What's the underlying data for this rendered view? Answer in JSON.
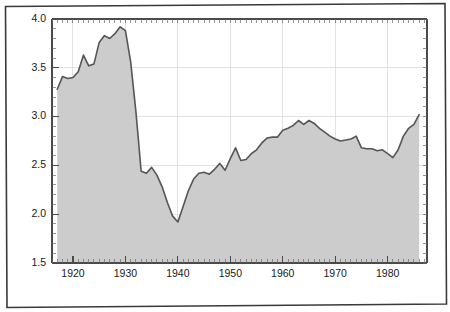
{
  "chart_data": {
    "type": "area",
    "title": "",
    "subtitle": "",
    "xlabel": "",
    "ylabel": "",
    "xlim": [
      1916.0,
      1987.5
    ],
    "ylim": [
      1.5,
      4.0
    ],
    "grid": true,
    "legend": null,
    "annotations": [],
    "x_ticks_major": [
      1920,
      1930,
      1940,
      1950,
      1960,
      1970,
      1980
    ],
    "x_tick_labels": [
      "1920",
      "1930",
      "1940",
      "1950",
      "1960",
      "1970",
      "1980"
    ],
    "x_tick_minor_step": 1,
    "y_ticks_major": [
      1.5,
      2.0,
      2.5,
      3.0,
      3.5,
      4.0
    ],
    "y_tick_labels": [
      "1.5",
      "2.0",
      "2.5",
      "3.0",
      "3.5",
      "4.0"
    ],
    "y_tick_minor_step": 0.1,
    "series": [
      {
        "name": "series-1",
        "line_color": "#555555",
        "fill_color": "#c9c9c9",
        "baseline": 1.5,
        "x": [
          1917,
          1918,
          1919,
          1920,
          1921,
          1922,
          1923,
          1924,
          1925,
          1926,
          1927,
          1928,
          1929,
          1930,
          1931,
          1932,
          1933,
          1934,
          1935,
          1936,
          1937,
          1938,
          1939,
          1940,
          1941,
          1942,
          1943,
          1944,
          1945,
          1946,
          1947,
          1948,
          1949,
          1950,
          1951,
          1952,
          1953,
          1954,
          1955,
          1956,
          1957,
          1958,
          1959,
          1960,
          1961,
          1962,
          1963,
          1964,
          1965,
          1966,
          1967,
          1968,
          1969,
          1970,
          1971,
          1972,
          1973,
          1974,
          1975,
          1976,
          1977,
          1978,
          1979,
          1980,
          1981,
          1982,
          1983,
          1984,
          1985,
          1986
        ],
        "y": [
          3.28,
          3.41,
          3.39,
          3.4,
          3.46,
          3.63,
          3.52,
          3.54,
          3.76,
          3.83,
          3.8,
          3.85,
          3.92,
          3.88,
          3.56,
          3.05,
          2.44,
          2.42,
          2.48,
          2.4,
          2.28,
          2.12,
          1.98,
          1.92,
          2.08,
          2.24,
          2.36,
          2.42,
          2.43,
          2.41,
          2.46,
          2.52,
          2.45,
          2.57,
          2.68,
          2.55,
          2.56,
          2.62,
          2.66,
          2.73,
          2.78,
          2.79,
          2.79,
          2.86,
          2.88,
          2.91,
          2.96,
          2.92,
          2.96,
          2.93,
          2.88,
          2.84,
          2.8,
          2.77,
          2.75,
          2.76,
          2.77,
          2.8,
          2.68,
          2.67,
          2.67,
          2.65,
          2.66,
          2.62,
          2.58,
          2.66,
          2.8,
          2.88,
          2.92,
          3.02
        ]
      }
    ]
  }
}
